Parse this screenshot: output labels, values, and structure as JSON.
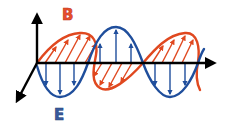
{
  "diagram": {
    "labels": {
      "magnetic": "B",
      "electric": "E"
    },
    "colors": {
      "axis": "#000000",
      "electric": "#1f4e9c",
      "magnetic": "#e0481f",
      "background": "#ffffff"
    },
    "components": [
      {
        "name": "magnetic-field-wave",
        "label": "B",
        "color": "#e0481f",
        "plane": "perspective/horizontal"
      },
      {
        "name": "electric-field-wave",
        "label": "E",
        "color": "#1f4e9c",
        "plane": "vertical"
      }
    ],
    "axes": [
      {
        "name": "vertical-axis",
        "direction": "up"
      },
      {
        "name": "propagation-axis",
        "direction": "right"
      },
      {
        "name": "depth-axis",
        "direction": "down-left"
      }
    ]
  }
}
